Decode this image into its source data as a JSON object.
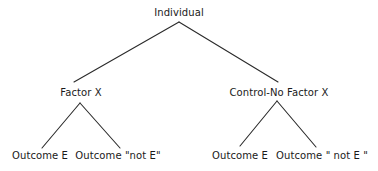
{
  "diagram": {
    "type": "tree",
    "root": {
      "label": "Individual",
      "children": [
        {
          "label": "Factor X",
          "children": [
            {
              "label": "Outcome E"
            },
            {
              "label": "Outcome \"not E\""
            }
          ]
        },
        {
          "label": "Control-No Factor X",
          "children": [
            {
              "label": "Outcome E"
            },
            {
              "label": "Outcome \" not E \""
            }
          ]
        }
      ]
    }
  },
  "nodes": {
    "root": "Individual",
    "factor_x": "Factor X",
    "control": "Control-No Factor X",
    "factor_x_outcome_e": "Outcome E",
    "factor_x_outcome_not_e": "Outcome \"not E\"",
    "control_outcome_e": "Outcome E",
    "control_outcome_not_e": "Outcome \" not E \""
  },
  "colors": {
    "line": "#2a2a2a",
    "text": "#1a1a1a",
    "background": "#ffffff"
  }
}
